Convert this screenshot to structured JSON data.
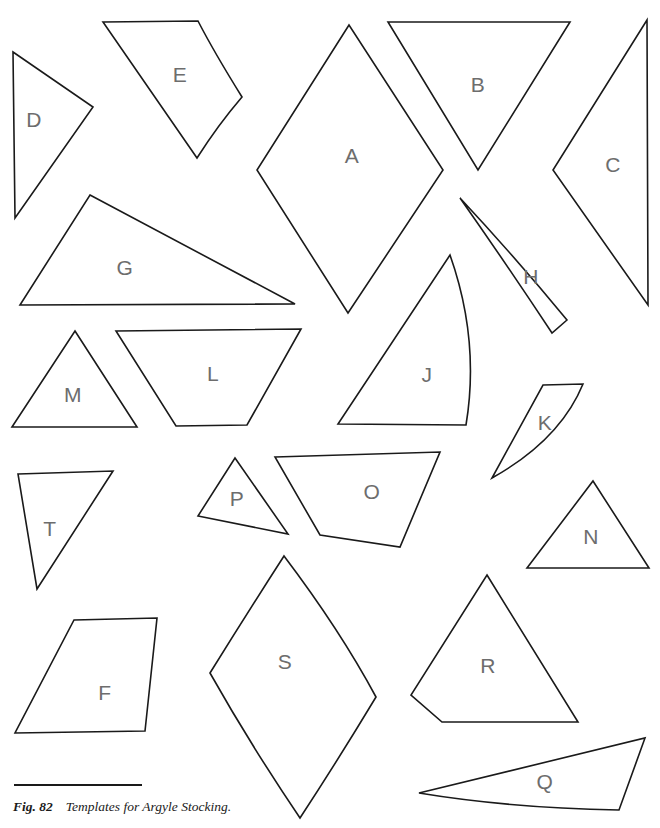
{
  "figure": {
    "caption_label": "Fig. 82",
    "caption_text": "Templates for Argyle Stocking.",
    "line_color": "#1a1a1a",
    "label_color": "#6d6d6d",
    "background_color": "#ffffff",
    "width": 660,
    "height": 828
  },
  "templates": [
    {
      "id": "A",
      "label": "A",
      "shape": "rhombus",
      "label_x": 352,
      "label_y": 157,
      "path": "M349 25 L257 170 L348 313 L443 170 Z"
    },
    {
      "id": "B",
      "label": "B",
      "shape": "triangle-down",
      "label_x": 478,
      "label_y": 86,
      "path": "M388 22 L570 22 L478 170 Z"
    },
    {
      "id": "C",
      "label": "C",
      "shape": "triangle-left",
      "label_x": 613,
      "label_y": 166,
      "path": "M647 20 L553 170 L648 305 Z"
    },
    {
      "id": "D",
      "label": "D",
      "shape": "triangle",
      "label_x": 34,
      "label_y": 121,
      "path": "M13 52 L93 107 L15 218 Z"
    },
    {
      "id": "E",
      "label": "E",
      "shape": "quadrilateral-curved",
      "label_x": 180,
      "label_y": 76,
      "path": "M103 22 L198 21 Q214 52 242 97 Q218 125 197 158 Z"
    },
    {
      "id": "F",
      "label": "F",
      "shape": "quadrilateral",
      "label_x": 105,
      "label_y": 694,
      "path": "M74 620 L157 618 L145 731 L15 733 Z"
    },
    {
      "id": "G",
      "label": "G",
      "shape": "triangle-flat",
      "label_x": 125,
      "label_y": 269,
      "path": "M90 195 L295 304 L20 305 Z"
    },
    {
      "id": "H",
      "label": "H",
      "shape": "curved-sliver",
      "label_x": 531,
      "label_y": 278,
      "path": "M460 198 Q516 258 567 320 L552 333 Q505 262 460 198 Z"
    },
    {
      "id": "J",
      "label": "J",
      "shape": "sail-curved",
      "label_x": 427,
      "label_y": 376,
      "path": "M450 255 Q480 340 466 425 L338 424 Z"
    },
    {
      "id": "K",
      "label": "K",
      "shape": "curved-sliver",
      "label_x": 545,
      "label_y": 424,
      "path": "M543 385 L583 384 Q560 440 492 478 Q520 427 543 385 Z"
    },
    {
      "id": "L",
      "label": "L",
      "shape": "trapezoid",
      "label_x": 213,
      "label_y": 375,
      "path": "M116 331 L301 329 L247 425 L176 426 Z"
    },
    {
      "id": "M",
      "label": "M",
      "shape": "triangle",
      "label_x": 73,
      "label_y": 396,
      "path": "M75 331 L137 427 L12 427 Z"
    },
    {
      "id": "N",
      "label": "N",
      "shape": "triangle",
      "label_x": 591,
      "label_y": 538,
      "path": "M593 481 L649 568 L527 568 Z"
    },
    {
      "id": "O",
      "label": "O",
      "shape": "quadrilateral",
      "label_x": 372,
      "label_y": 493,
      "path": "M275 457 L440 452 L400 547 L320 535 Z"
    },
    {
      "id": "P",
      "label": "P",
      "shape": "triangle",
      "label_x": 237,
      "label_y": 500,
      "path": "M235 458 L288 534 L198 516 Z"
    },
    {
      "id": "Q",
      "label": "Q",
      "shape": "curved-sliver",
      "label_x": 545,
      "label_y": 783,
      "path": "M419 793 L645 738 L619 810 Q510 808 419 793 Z"
    },
    {
      "id": "R",
      "label": "R",
      "shape": "pentagon",
      "label_x": 488,
      "label_y": 667,
      "path": "M487 575 L578 722 L442 722 L411 695 Z"
    },
    {
      "id": "S",
      "label": "S",
      "shape": "kite-curved",
      "label_x": 285,
      "label_y": 663,
      "path": "M284 556 Q340 630 376 697 Q338 760 300 818 Q250 744 210 673 Q246 615 284 556 Z"
    },
    {
      "id": "T",
      "label": "T",
      "shape": "triangle-down",
      "label_x": 50,
      "label_y": 530,
      "path": "M18 474 L113 471 L37 589 Z"
    }
  ]
}
